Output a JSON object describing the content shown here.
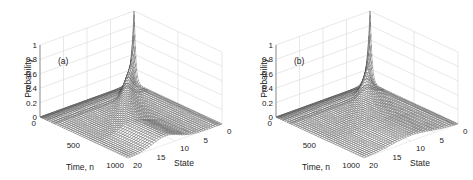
{
  "chart_data": [
    {
      "type": "surface",
      "panel_label": "(a)",
      "zlabel": "Probability",
      "xlabel": "Time, n",
      "ylabel": "State",
      "z_ticks": [
        "0",
        "0.2",
        "0.4",
        "0.6",
        "0.8",
        "1"
      ],
      "x_ticks": [
        "0",
        "500",
        "1000"
      ],
      "y_ticks": [
        "0",
        "5",
        "10",
        "15",
        "20"
      ],
      "zlim": [
        0,
        1
      ],
      "xlim": [
        0,
        1000
      ],
      "ylim": [
        0,
        20
      ],
      "grid": true,
      "description": "Probability mass starts at state 0 (value ~1 at n=0), decays quickly, and spreads into a ridge that drifts toward states ~10-15 by n=1000",
      "peak": {
        "time": 0,
        "state": 0,
        "probability": 1.0
      },
      "ridge_center_state_at_end": 12,
      "ridge_height": 0.12,
      "ridge_width": 3
    },
    {
      "type": "surface",
      "panel_label": "(b)",
      "zlabel": "Probability",
      "xlabel": "Time, n",
      "ylabel": "State",
      "z_ticks": [
        "0",
        "0.2",
        "0.4",
        "0.6",
        "0.8",
        "1"
      ],
      "x_ticks": [
        "0",
        "500",
        "1000"
      ],
      "y_ticks": [
        "0",
        "5",
        "10",
        "15",
        "20"
      ],
      "zlim": [
        0,
        1
      ],
      "xlim": [
        0,
        1000
      ],
      "ylim": [
        0,
        20
      ],
      "grid": true,
      "description": "Probability mass starts at state 0 (value ~1 at n=0), decays quickly, and spreads into a broader, flatter distribution over states by n=1000",
      "peak": {
        "time": 0,
        "state": 0,
        "probability": 1.0
      },
      "ridge_center_state_at_end": 10,
      "ridge_height": 0.08,
      "ridge_width": 5
    }
  ]
}
